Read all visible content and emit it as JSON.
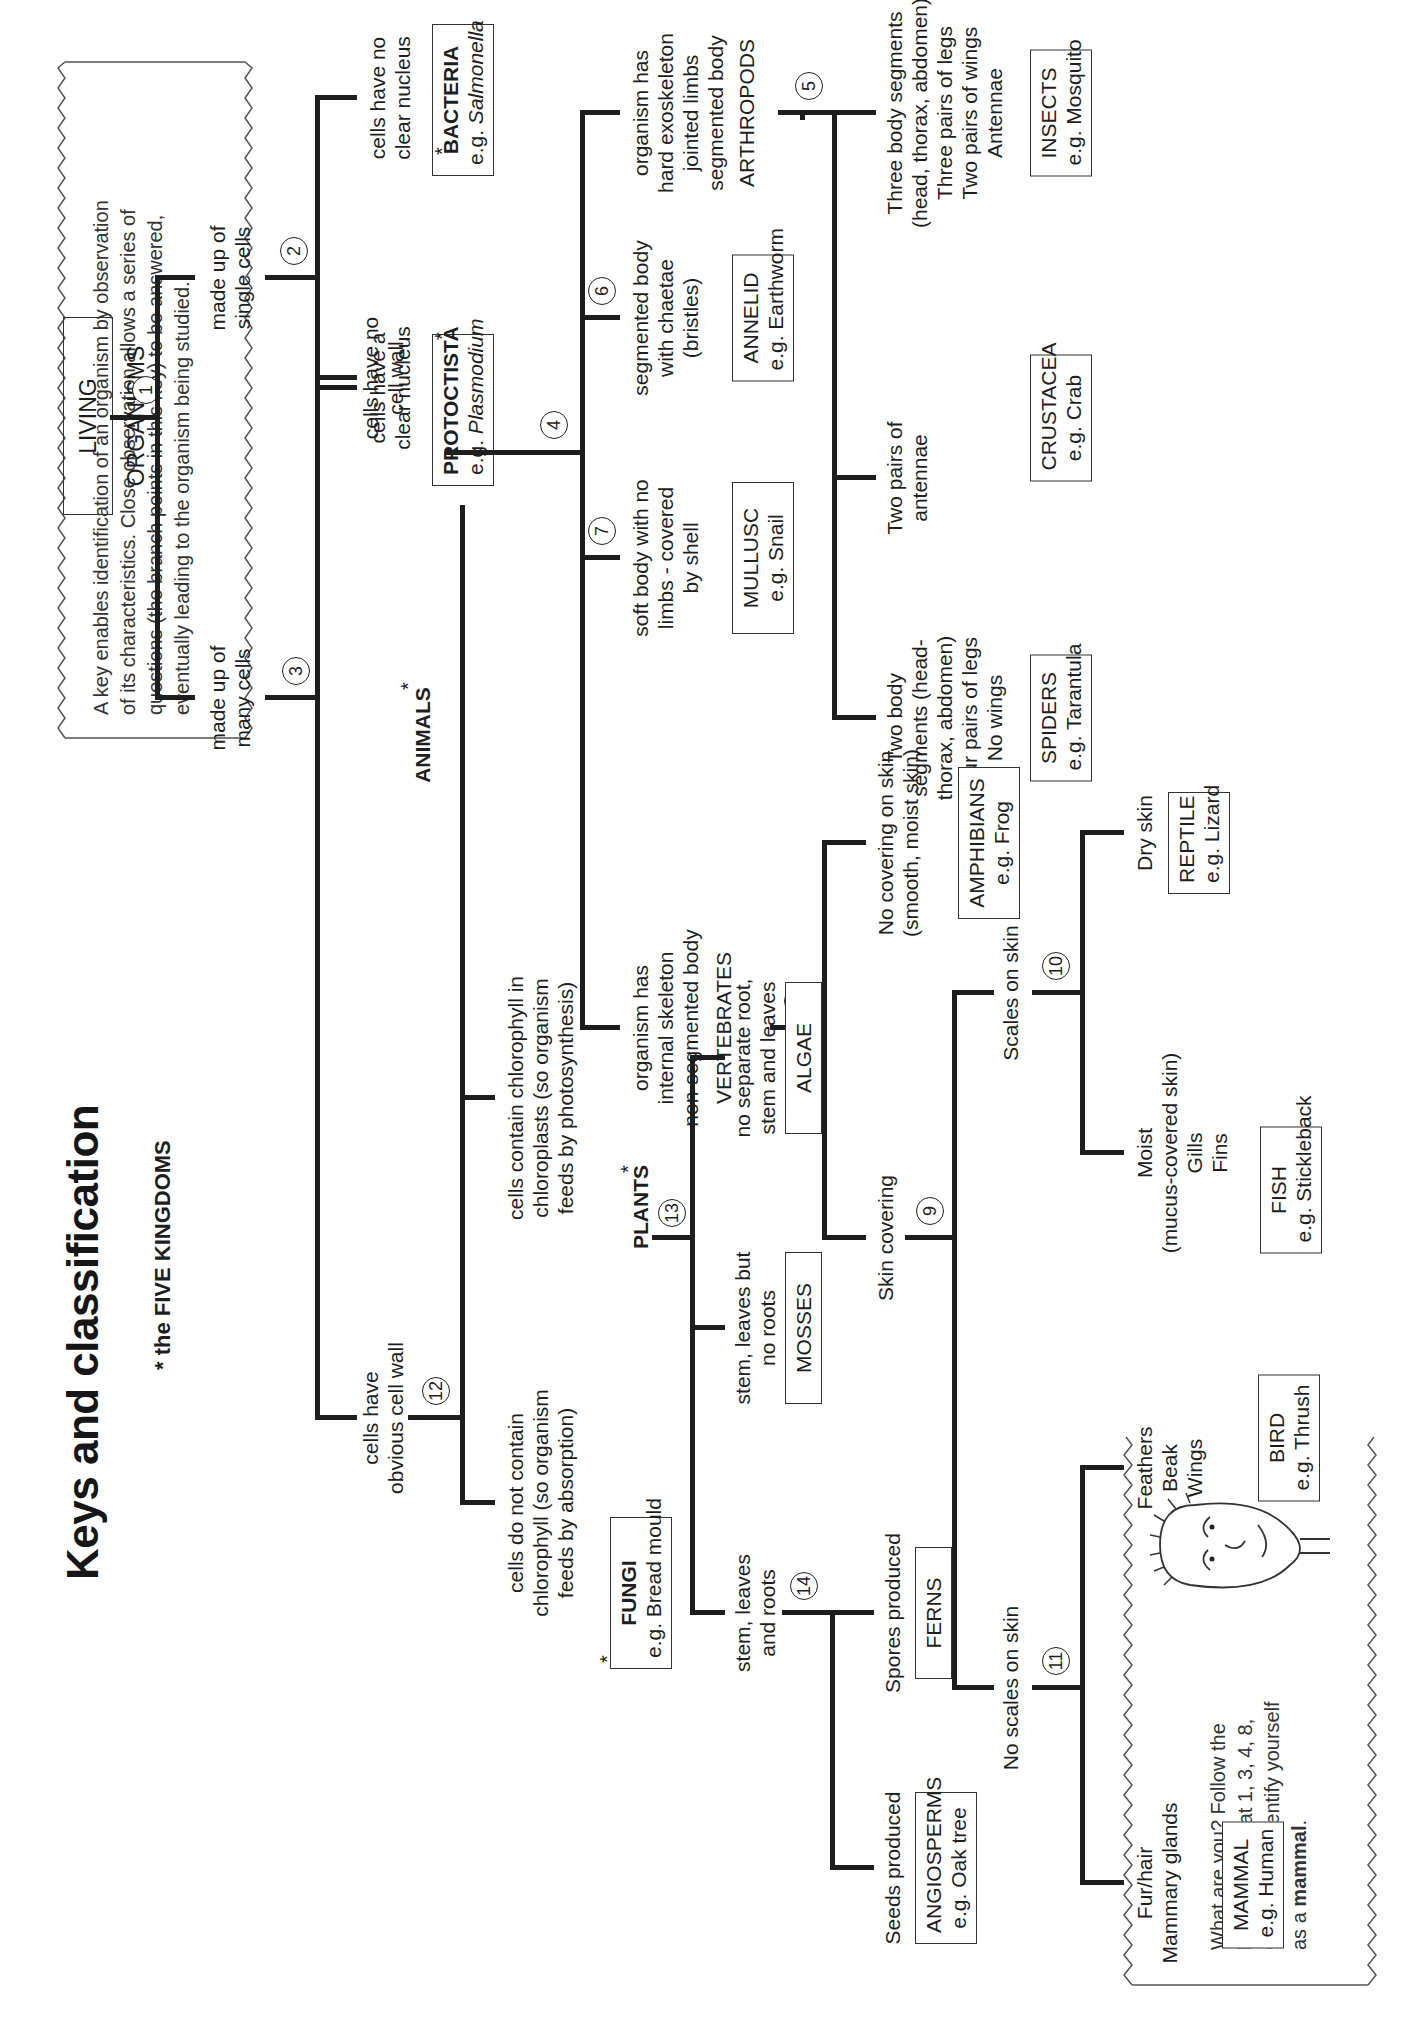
{
  "title": "Keys and classification",
  "subtitle": "* the FIVE KINGDOMS",
  "intro_note": {
    "lines": [
      "A key enables identification of an organism by observation",
      "of its characteristics. Close observation allows a series of",
      "questions (the branch points in this key) to be answered,",
      "eventually leading to the organism being studied."
    ]
  },
  "activity_note": {
    "lines": [
      "What are you? Follow the",
      "branch points at 1, 3, 4, 8,",
      "9, and 11 to identify yourself"
    ],
    "last_prefix": "as a ",
    "last_bold": "mammal",
    "last_suffix": ".",
    "illustration": "cartoon-face"
  },
  "root": "LIVING ORGANISMS",
  "branch_points": [
    "1",
    "2",
    "3",
    "4",
    "5",
    "6",
    "7",
    "8",
    "9",
    "10",
    "11",
    "12",
    "13",
    "14"
  ],
  "kingdom_marker": "*",
  "questions": {
    "single_cells": [
      "made up of",
      "single cells"
    ],
    "many_cells": [
      "made up of",
      "many cells"
    ],
    "no_nucleus": [
      "cells have no",
      "clear nucleus"
    ],
    "nucleus": [
      "cells have a",
      "clear nucleus"
    ],
    "no_cell_wall": [
      "cells have no",
      "cell wall"
    ],
    "cell_wall": [
      "cells have",
      "obvious cell wall"
    ],
    "chlorophyll": [
      "cells contain chlorophyll in",
      "chloroplasts (so organism",
      "feeds by photosynthesis)"
    ],
    "no_chlorophyll": [
      "cells do not contain",
      "chlorophyll (so organism",
      "feeds by absorption)"
    ],
    "no_root": [
      "no separate root,",
      "stem and leaves"
    ],
    "no_roots": [
      "stem, leaves but",
      "no roots"
    ],
    "with_roots": [
      "stem, leaves",
      "and roots"
    ],
    "spores": [
      "Spores produced"
    ],
    "seeds": [
      "Seeds produced"
    ],
    "exoskeleton": [
      "organism has",
      "hard exoskeleton",
      "jointed limbs",
      "segmented body"
    ],
    "chaetae": [
      "segmented body",
      "with chaetae",
      "(bristles)"
    ],
    "soft_body": [
      "soft body with no",
      "limbs - covered",
      "by shell"
    ],
    "internal_skeleton": [
      "organism has",
      "internal skeleton",
      "non-segmented body"
    ],
    "three_segments": [
      "Three body segments",
      "(head, thorax, abdomen)",
      "Three pairs of legs",
      "Two pairs of wings",
      "Antennae"
    ],
    "two_antennae": [
      "Two pairs of",
      "antennae"
    ],
    "two_segments": [
      "Two body",
      "segments (head-",
      "thorax, abdomen)",
      "Four pairs of legs",
      "No wings"
    ],
    "no_covering": [
      "No covering on skin",
      "(smooth, moist skin)"
    ],
    "skin_covering": [
      "Skin covering"
    ],
    "scales": [
      "Scales on skin"
    ],
    "no_scales": [
      "No scales on skin"
    ],
    "dry_skin": [
      "Dry skin"
    ],
    "moist": [
      "Moist",
      "(mucus-covered skin)",
      "Gills",
      "Fins"
    ],
    "feathers": [
      "Feathers",
      "Beak",
      "Wings"
    ],
    "fur": [
      "Fur/hair",
      "Mammary glands"
    ]
  },
  "groups": {
    "animals": "ANIMALS",
    "plants": "PLANTS",
    "arthropods": "ARTHROPODS",
    "vertebrates": "VERTEBRATES"
  },
  "organisms": {
    "bacteria": {
      "name": "BACTERIA",
      "example_prefix": "e.g. ",
      "example": "Salmonella"
    },
    "protoctista": {
      "name": "PROTOCTISTA",
      "example_prefix": "e.g. ",
      "example": "Plasmodium"
    },
    "fungi": {
      "name": "FUNGI",
      "example": "e.g. Bread mould"
    },
    "algae": {
      "name": "ALGAE"
    },
    "mosses": {
      "name": "MOSSES"
    },
    "ferns": {
      "name": "FERNS"
    },
    "angiosperms": {
      "name": "ANGIOSPERMS",
      "example": "e.g. Oak tree"
    },
    "insects": {
      "name": "INSECTS",
      "example": "e.g. Mosquito"
    },
    "crustacea": {
      "name": "CRUSTACEA",
      "example": "e.g. Crab"
    },
    "spiders": {
      "name": "SPIDERS",
      "example": "e.g. Tarantula"
    },
    "annelid": {
      "name": "ANNELID",
      "example": "e.g. Earthworm"
    },
    "mullusc": {
      "name": "MULLUSC",
      "example": "e.g. Snail"
    },
    "amphibians": {
      "name": "AMPHIBIANS",
      "example": "e.g. Frog"
    },
    "reptile": {
      "name": "REPTILE",
      "example": "e.g. Lizard"
    },
    "fish": {
      "name": "FISH",
      "example": "e.g. Stickleback"
    },
    "bird": {
      "name": "BIRD",
      "example": "e.g. Thrush"
    },
    "mammal": {
      "name": "MAMMAL",
      "example": "e.g. Human"
    }
  }
}
